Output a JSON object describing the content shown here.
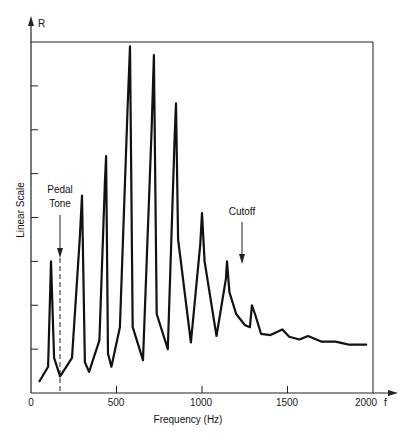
{
  "chart_data": {
    "type": "line",
    "title": "",
    "xlabel": "Frequency (Hz)",
    "ylabel": "Linear Scale",
    "y_axis_symbol": "R",
    "x_axis_symbol": "f",
    "xlim": [
      0,
      2000
    ],
    "ylim": [
      0,
      8
    ],
    "x_ticks": [
      0,
      500,
      1000,
      1500,
      2000
    ],
    "x_tick_labels": [
      "0",
      "500",
      "1000",
      "1500",
      "2000"
    ],
    "y_ticks": [
      1,
      2,
      3,
      4,
      5,
      6,
      7,
      8
    ],
    "y_tick_labels": [],
    "grid": false,
    "legend": null,
    "annotations": [
      {
        "text": "Pedal Tone",
        "x": 170,
        "type": "arrow-down with dashed vertical line"
      },
      {
        "text": "Cutoff",
        "x": 1230,
        "type": "arrow-down"
      }
    ],
    "series": [
      {
        "name": "Resonance R",
        "x": [
          50,
          100,
          117,
          135,
          170,
          240,
          285,
          298,
          315,
          340,
          400,
          432,
          439,
          450,
          470,
          520,
          565,
          579,
          595,
          655,
          705,
          719,
          735,
          800,
          840,
          848,
          860,
          935,
          990,
          1000,
          1015,
          1085,
          1140,
          1146,
          1160,
          1200,
          1250,
          1280,
          1292,
          1310,
          1345,
          1400,
          1470,
          1510,
          1570,
          1620,
          1700,
          1780,
          1840,
          1860,
          1960
        ],
        "values": [
          0.27,
          0.6,
          3.0,
          0.8,
          0.38,
          0.8,
          3.5,
          4.5,
          0.7,
          0.48,
          1.2,
          4.8,
          5.4,
          0.9,
          0.6,
          1.5,
          6.5,
          7.9,
          1.5,
          0.75,
          6.0,
          7.7,
          1.8,
          1.0,
          5.8,
          6.6,
          3.5,
          1.15,
          3.4,
          4.1,
          3.0,
          1.3,
          2.6,
          3.0,
          2.3,
          1.8,
          1.55,
          1.5,
          2.0,
          1.8,
          1.35,
          1.32,
          1.45,
          1.28,
          1.22,
          1.3,
          1.17,
          1.17,
          1.12,
          1.1,
          1.1
        ]
      }
    ],
    "peaks": [
      {
        "f": 117,
        "R": 3.0
      },
      {
        "f": 298,
        "R": 4.5
      },
      {
        "f": 439,
        "R": 5.4
      },
      {
        "f": 579,
        "R": 7.9
      },
      {
        "f": 719,
        "R": 7.7
      },
      {
        "f": 848,
        "R": 6.6
      },
      {
        "f": 1000,
        "R": 4.1
      },
      {
        "f": 1146,
        "R": 3.0
      },
      {
        "f": 1292,
        "R": 2.0
      }
    ]
  },
  "labels": {
    "y_axis_symbol": "R",
    "y_axis_title": "Linear Scale",
    "x_axis_title": "Frequency (Hz)",
    "x_axis_symbol": "f",
    "pedal_line1": "Pedal",
    "pedal_line2": "Tone",
    "cutoff": "Cutoff",
    "ticks": [
      "0",
      "500",
      "1000",
      "1500",
      "2000"
    ]
  }
}
